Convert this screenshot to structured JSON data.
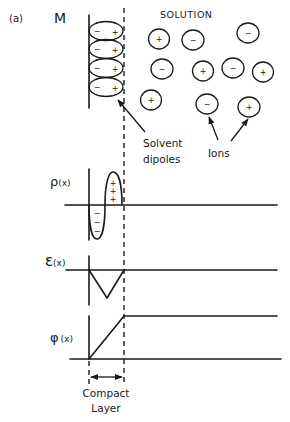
{
  "figure": {
    "panel_label": "(a)",
    "metal_label": "M",
    "solution_label": "SOLUTION",
    "solvent_label_line1": "Solvent",
    "solvent_label_line2": "dipoles",
    "ions_label": "Ions",
    "compact_label_line1": "Compact",
    "compact_label_line2": "Layer"
  },
  "plots": {
    "rho": {
      "label_symbol": "ρ",
      "label_arg": "(x)",
      "lobe_pos_signs": [
        "+",
        "+",
        "+"
      ],
      "lobe_neg_signs": [
        "−",
        "−",
        "−"
      ]
    },
    "epsilon": {
      "label_symbol": "ε",
      "label_arg": "(x)"
    },
    "phi": {
      "label_symbol": "φ",
      "label_arg": "(x)"
    }
  },
  "dipoles": [
    {
      "neg": "−",
      "pos": "+",
      "cy": 31
    },
    {
      "neg": "−",
      "pos": "+",
      "cy": 49
    },
    {
      "neg": "−",
      "pos": "+",
      "cy": 68
    },
    {
      "neg": "−",
      "pos": "+",
      "cy": 87
    }
  ],
  "ions": [
    {
      "charge": "+",
      "cx": 159,
      "cy": 39
    },
    {
      "charge": "−",
      "cx": 193,
      "cy": 40
    },
    {
      "charge": "−",
      "cx": 248,
      "cy": 33
    },
    {
      "charge": "−",
      "cx": 162,
      "cy": 69
    },
    {
      "charge": "+",
      "cx": 203,
      "cy": 71
    },
    {
      "charge": "−",
      "cx": 233,
      "cy": 68
    },
    {
      "charge": "+",
      "cx": 263,
      "cy": 72
    },
    {
      "charge": "+",
      "cx": 151,
      "cy": 100
    },
    {
      "charge": "−",
      "cx": 207,
      "cy": 104
    },
    {
      "charge": "+",
      "cx": 249,
      "cy": 107
    }
  ],
  "colors": {
    "ink": "#1a1a1a",
    "background": "#ffffff"
  }
}
